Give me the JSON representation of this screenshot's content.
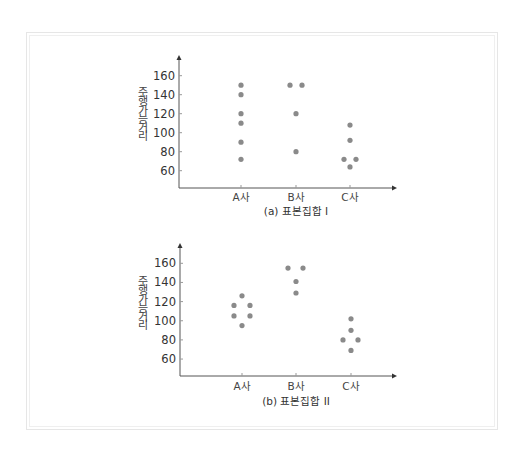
{
  "chart_data": [
    {
      "type": "scatter",
      "title": "(a) 표본집합 I",
      "xlabel": "",
      "ylabel": "주행 가능 거리",
      "ylabel_chars": [
        "주",
        "행",
        "가",
        "능",
        "거",
        "리"
      ],
      "categories": [
        "A사",
        "B사",
        "C사"
      ],
      "yticks": [
        60,
        80,
        100,
        120,
        140,
        160
      ],
      "ylim": [
        40,
        175
      ],
      "grid": false,
      "series": [
        {
          "name": "A사",
          "values": [
            150,
            140,
            120,
            110,
            90,
            72
          ],
          "offsets": [
            0,
            0,
            0,
            0,
            0,
            0
          ]
        },
        {
          "name": "B사",
          "values": [
            150,
            150,
            120,
            80
          ],
          "offsets": [
            -6,
            6,
            0,
            0
          ]
        },
        {
          "name": "C사",
          "values": [
            108,
            92,
            72,
            72,
            64
          ],
          "offsets": [
            0,
            0,
            -6,
            6,
            0
          ]
        }
      ]
    },
    {
      "type": "scatter",
      "title": "(b) 표본집합 II",
      "xlabel": "",
      "ylabel": "주행 가능 거리",
      "ylabel_chars": [
        "주",
        "행",
        "가",
        "능",
        "거",
        "리"
      ],
      "categories": [
        "A사",
        "B사",
        "C사"
      ],
      "yticks": [
        60,
        80,
        100,
        120,
        140,
        160
      ],
      "ylim": [
        40,
        175
      ],
      "grid": false,
      "series": [
        {
          "name": "A사",
          "values": [
            126,
            116,
            116,
            105,
            105,
            95
          ],
          "offsets": [
            0,
            -8,
            8,
            -8,
            8,
            0
          ]
        },
        {
          "name": "B사",
          "values": [
            155,
            155,
            141,
            129
          ],
          "offsets": [
            -8,
            7,
            0,
            0
          ]
        },
        {
          "name": "C사",
          "values": [
            102,
            90,
            80,
            80,
            69
          ],
          "offsets": [
            0,
            0,
            -8,
            7,
            0
          ]
        }
      ]
    }
  ],
  "style": {
    "dot_color": "#8a8a8a",
    "axis_color": "#555555",
    "frame_color": "#e6e6e6"
  }
}
